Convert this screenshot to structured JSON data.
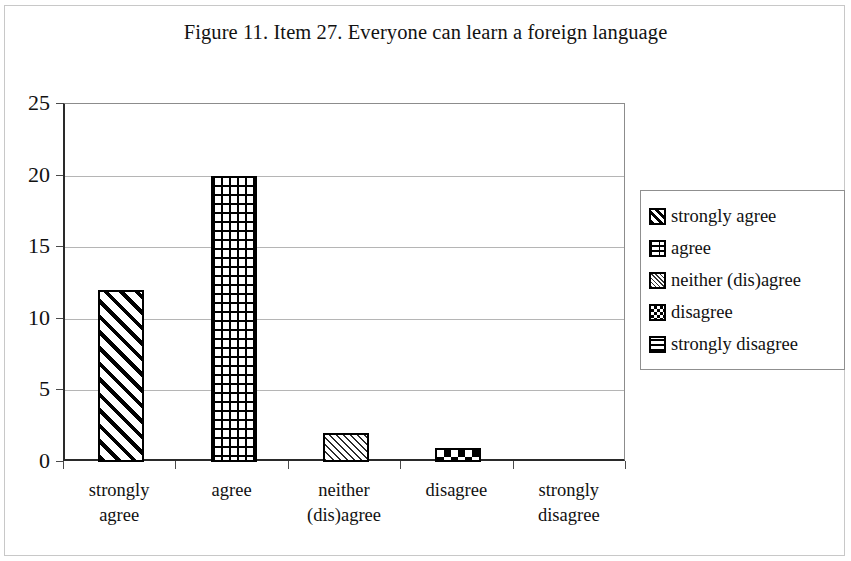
{
  "figure": {
    "title": "Figure 11. Item 27. Everyone can learn a foreign language"
  },
  "axes": {
    "y_ticks": [
      "0",
      "5",
      "10",
      "15",
      "20",
      "25"
    ],
    "x_categories": [
      {
        "line1": "strongly",
        "line2": "agree"
      },
      {
        "line1": "agree",
        "line2": ""
      },
      {
        "line1": "neither",
        "line2": "(dis)agree"
      },
      {
        "line1": "disagree",
        "line2": ""
      },
      {
        "line1": "strongly",
        "line2": "disagree"
      }
    ]
  },
  "legend": {
    "items": [
      {
        "label": "strongly agree",
        "pattern": "diagonal-stripes-bold"
      },
      {
        "label": "agree",
        "pattern": "brick"
      },
      {
        "label": "neither (dis)agree",
        "pattern": "diagonal-stripes-light"
      },
      {
        "label": "disagree",
        "pattern": "checkerboard"
      },
      {
        "label": "strongly disagree",
        "pattern": "horizontal-lines"
      }
    ]
  },
  "chart_data": {
    "type": "bar",
    "title": "Figure 11. Item 27. Everyone can learn a foreign language",
    "xlabel": "",
    "ylabel": "",
    "categories": [
      "strongly agree",
      "agree",
      "neither (dis)agree",
      "disagree",
      "strongly disagree"
    ],
    "values": [
      12,
      20,
      2,
      1,
      0
    ],
    "ylim": [
      0,
      25
    ],
    "ytick_step": 5,
    "grid": true,
    "legend_position": "right",
    "series": [
      {
        "name": "responses",
        "values": [
          12,
          20,
          2,
          1,
          0
        ],
        "patterns": [
          "diagonal-stripes-bold",
          "brick",
          "diagonal-stripes-light",
          "checkerboard",
          "horizontal-lines"
        ]
      }
    ]
  }
}
